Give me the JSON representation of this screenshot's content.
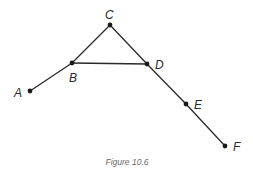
{
  "figure": {
    "caption": "Figure 10.6",
    "line_color": "#2a2a2a",
    "node_color": "#1a1a1a",
    "caption_color": "#6a6a6a"
  },
  "nodes": [
    {
      "id": "A",
      "label": "A",
      "x": 30,
      "y": 91,
      "label_x": 14,
      "label_y": 97
    },
    {
      "id": "B",
      "label": "B",
      "x": 72,
      "y": 63,
      "label_x": 69,
      "label_y": 82
    },
    {
      "id": "C",
      "label": "C",
      "x": 110,
      "y": 25,
      "label_x": 105,
      "label_y": 19
    },
    {
      "id": "D",
      "label": "D",
      "x": 147,
      "y": 64,
      "label_x": 155,
      "label_y": 69
    },
    {
      "id": "E",
      "label": "E",
      "x": 186,
      "y": 104,
      "label_x": 194,
      "label_y": 109
    },
    {
      "id": "F",
      "label": "F",
      "x": 225,
      "y": 146,
      "label_x": 233,
      "label_y": 151
    }
  ],
  "edges": [
    {
      "from": "A",
      "to": "B"
    },
    {
      "from": "B",
      "to": "C"
    },
    {
      "from": "B",
      "to": "D"
    },
    {
      "from": "C",
      "to": "D"
    },
    {
      "from": "D",
      "to": "E"
    },
    {
      "from": "E",
      "to": "F"
    }
  ]
}
